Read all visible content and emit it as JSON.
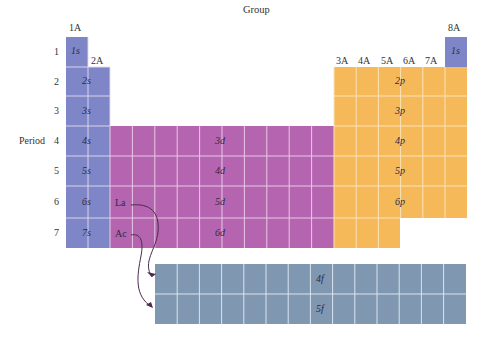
{
  "diagram": {
    "group_label": "Group",
    "period_label": "Period",
    "group_headers": [
      {
        "label": "1A",
        "x": 69,
        "y": 22
      },
      {
        "label": "2A",
        "x": 91,
        "y": 56
      },
      {
        "label": "3A",
        "x": 337,
        "y": 56
      },
      {
        "label": "4A",
        "x": 359,
        "y": 56
      },
      {
        "label": "5A",
        "x": 381,
        "y": 56
      },
      {
        "label": "6A",
        "x": 403,
        "y": 56
      },
      {
        "label": "7A",
        "x": 425,
        "y": 56
      },
      {
        "label": "8A",
        "x": 448,
        "y": 22
      }
    ],
    "periods": [
      "1",
      "2",
      "3",
      "4",
      "5",
      "6",
      "7"
    ],
    "blocks": {
      "s": {
        "color": "#7f86c8",
        "labels": [
          "1s",
          "2s",
          "3s",
          "4s",
          "5s",
          "6s",
          "7s"
        ],
        "he_label": "1s"
      },
      "d": {
        "color": "#b565b0",
        "labels": [
          "3d",
          "4d",
          "5d",
          "6d"
        ]
      },
      "p": {
        "color": "#f5b95a",
        "labels": [
          "2p",
          "3p",
          "4p",
          "5p",
          "6p"
        ]
      },
      "f": {
        "color": "#7f97b0",
        "labels": [
          "4f",
          "5f"
        ]
      }
    },
    "lanthanide_marker": "La",
    "actinide_marker": "Ac",
    "grid_line_color": "#f3e6f3"
  }
}
